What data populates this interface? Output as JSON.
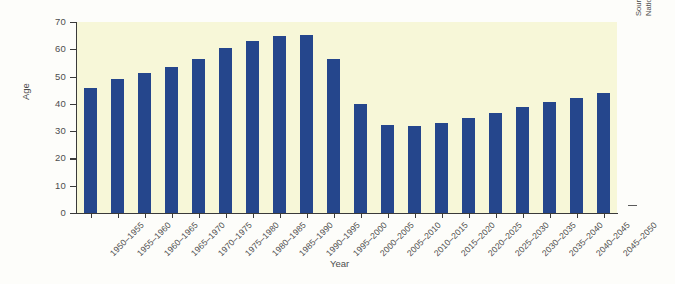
{
  "chart_data": {
    "type": "bar",
    "title": "",
    "xlabel": "Year",
    "ylabel": "Age",
    "ylim": [
      0,
      70
    ],
    "yticks": [
      0,
      10,
      20,
      30,
      40,
      50,
      60,
      70
    ],
    "grid": false,
    "legend": null,
    "bar_color": "#25468c",
    "plot_background": "#f7f7d8",
    "categories": [
      "1950–1955",
      "1955–1960",
      "1960–1965",
      "1965–1970",
      "1970–1975",
      "1975–1980",
      "1980–1985",
      "1985–1990",
      "1990–1995",
      "1995–2000",
      "2000–2005",
      "2005–2010",
      "2010–2015",
      "2015–2020",
      "2020–2025",
      "2025–2030",
      "2030–2035",
      "2035–2040",
      "2040–2045",
      "2045–2050"
    ],
    "values": [
      45.8,
      49.2,
      51.4,
      53.5,
      56.3,
      60.3,
      63.0,
      65.0,
      65.3,
      56.6,
      39.9,
      32.4,
      31.9,
      33.1,
      34.9,
      36.6,
      38.7,
      40.8,
      42.3,
      44.1
    ]
  },
  "notes": {
    "source": "Source: Compiled by the authors using data from United Nations and U.S. Census Bureau."
  }
}
